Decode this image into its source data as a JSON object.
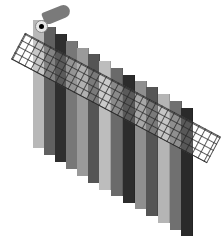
{
  "figure": {
    "strips": [
      {
        "x": 33,
        "top": 20,
        "bottom": 148,
        "color": "#b8b8b8"
      },
      {
        "x": 44,
        "top": 27,
        "bottom": 155,
        "color": "#606060"
      },
      {
        "x": 55,
        "top": 34,
        "bottom": 162,
        "color": "#2e2e2e"
      },
      {
        "x": 66,
        "top": 41,
        "bottom": 169,
        "color": "#777777"
      },
      {
        "x": 77,
        "top": 48,
        "bottom": 176,
        "color": "#9a9a9a"
      },
      {
        "x": 88,
        "top": 54,
        "bottom": 183,
        "color": "#555555"
      },
      {
        "x": 99,
        "top": 61,
        "bottom": 190,
        "color": "#bdbdbd"
      },
      {
        "x": 111,
        "top": 68,
        "bottom": 196,
        "color": "#6a6a6a"
      },
      {
        "x": 123,
        "top": 75,
        "bottom": 203,
        "color": "#2c2c2c"
      },
      {
        "x": 135,
        "top": 81,
        "bottom": 209,
        "color": "#8f8f8f"
      },
      {
        "x": 146,
        "top": 87,
        "bottom": 216,
        "color": "#555555"
      },
      {
        "x": 158,
        "top": 94,
        "bottom": 223,
        "color": "#b5b5b5"
      },
      {
        "x": 170,
        "top": 101,
        "bottom": 230,
        "color": "#707070"
      },
      {
        "x": 181,
        "top": 108,
        "bottom": 236,
        "color": "#2a2a2a"
      }
    ],
    "strip_width": 12,
    "overlay": {
      "type": "grid-ruler",
      "angle_deg": 28,
      "cell_px": 7
    },
    "pin": {
      "type": "swatch-rivet"
    }
  }
}
